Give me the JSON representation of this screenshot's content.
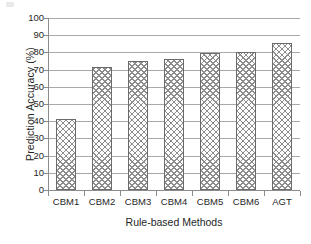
{
  "chart_data": {
    "type": "bar",
    "title": "",
    "xlabel": "Rule-based Methods",
    "ylabel": "Prediction Accuracy (%)",
    "categories": [
      "CBM1",
      "CBM2",
      "CBM3",
      "CBM4",
      "CBM5",
      "CBM6",
      "AGT"
    ],
    "values": [
      41.5,
      71.5,
      74.8,
      76.0,
      79.5,
      80.3,
      85.2
    ],
    "ylim": [
      0,
      100
    ],
    "ytick_labels": [
      "100",
      "90",
      "80",
      "70",
      "60",
      "50",
      "40",
      "30",
      "20",
      "10",
      "0"
    ],
    "ytick_values": [
      100,
      90,
      80,
      70,
      60,
      50,
      40,
      30,
      20,
      10,
      0
    ],
    "grid": true,
    "legend": "none",
    "series": [
      {
        "name": "Prediction Accuracy",
        "values": [
          41.5,
          71.5,
          74.8,
          76.0,
          79.5,
          80.3,
          85.2
        ]
      }
    ],
    "colors": {
      "bar_fill": "#ffffff",
      "bar_hatch": "#8d8d8d",
      "bar_border": "#6b6b6b",
      "gridline": "#a9a9a9",
      "axis": "#8c8c8c",
      "text": "#1f1f1f",
      "background": "#ffffff"
    }
  }
}
